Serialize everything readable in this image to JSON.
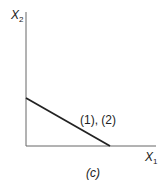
{
  "diagram": {
    "y_axis_label": "X",
    "y_axis_sub": "2",
    "x_axis_label": "X",
    "x_axis_sub": "1",
    "line_label": "(1), (2)",
    "caption": "(c)",
    "colors": {
      "line": "#222222",
      "axis": "#555555"
    }
  }
}
